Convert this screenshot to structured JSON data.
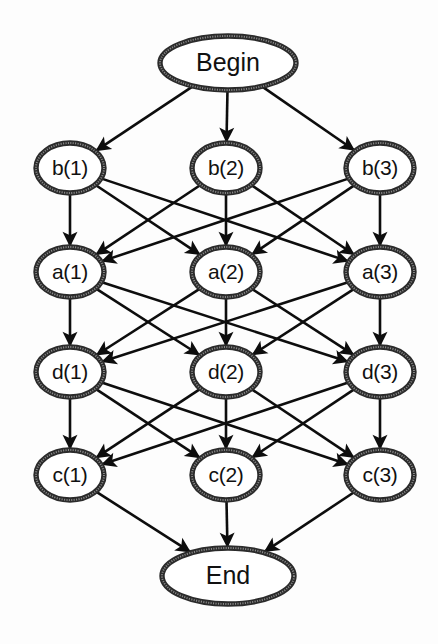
{
  "diagram": {
    "type": "layered-directed-graph",
    "canvas": {
      "width": 438,
      "height": 644,
      "background": "#fdfdfd"
    },
    "style": {
      "node_fill": "#ffffff",
      "node_border": "#2b2b2b",
      "node_border_texture": "#8a8a8a",
      "edge_color": "#0d0d0d",
      "label_color": "#111111"
    },
    "columns_x": [
      70,
      226,
      380
    ],
    "terminal_rx": 68,
    "terminal_ry": 27,
    "state_rx": 34,
    "state_ry": 25,
    "nodes": {
      "begin": {
        "id": "begin",
        "label": "Begin",
        "x": 228,
        "y": 63,
        "rx": 68,
        "ry": 27,
        "kind": "terminal"
      },
      "end": {
        "id": "end",
        "label": "End",
        "x": 228,
        "y": 576,
        "rx": 66,
        "ry": 28,
        "kind": "terminal"
      },
      "b1": {
        "id": "b1",
        "label": "b(1)",
        "x": 70,
        "y": 168,
        "rx": 34,
        "ry": 25,
        "kind": "state",
        "layer": "b"
      },
      "b2": {
        "id": "b2",
        "label": "b(2)",
        "x": 226,
        "y": 168,
        "rx": 34,
        "ry": 25,
        "kind": "state",
        "layer": "b"
      },
      "b3": {
        "id": "b3",
        "label": "b(3)",
        "x": 380,
        "y": 168,
        "rx": 34,
        "ry": 25,
        "kind": "state",
        "layer": "b"
      },
      "a1": {
        "id": "a1",
        "label": "a(1)",
        "x": 70,
        "y": 272,
        "rx": 34,
        "ry": 25,
        "kind": "state",
        "layer": "a"
      },
      "a2": {
        "id": "a2",
        "label": "a(2)",
        "x": 226,
        "y": 272,
        "rx": 34,
        "ry": 25,
        "kind": "state",
        "layer": "a"
      },
      "a3": {
        "id": "a3",
        "label": "a(3)",
        "x": 380,
        "y": 272,
        "rx": 34,
        "ry": 25,
        "kind": "state",
        "layer": "a"
      },
      "d1": {
        "id": "d1",
        "label": "d(1)",
        "x": 70,
        "y": 372,
        "rx": 34,
        "ry": 25,
        "kind": "state",
        "layer": "d"
      },
      "d2": {
        "id": "d2",
        "label": "d(2)",
        "x": 226,
        "y": 372,
        "rx": 34,
        "ry": 25,
        "kind": "state",
        "layer": "d"
      },
      "d3": {
        "id": "d3",
        "label": "d(3)",
        "x": 380,
        "y": 372,
        "rx": 34,
        "ry": 25,
        "kind": "state",
        "layer": "d"
      },
      "c1": {
        "id": "c1",
        "label": "c(1)",
        "x": 70,
        "y": 475,
        "rx": 34,
        "ry": 25,
        "kind": "state",
        "layer": "c"
      },
      "c2": {
        "id": "c2",
        "label": "c(2)",
        "x": 226,
        "y": 475,
        "rx": 34,
        "ry": 25,
        "kind": "state",
        "layer": "c"
      },
      "c3": {
        "id": "c3",
        "label": "c(3)",
        "x": 380,
        "y": 475,
        "rx": 34,
        "ry": 25,
        "kind": "state",
        "layer": "c"
      }
    },
    "layers": [
      {
        "name": "begin",
        "node_ids": [
          "begin"
        ]
      },
      {
        "name": "b",
        "node_ids": [
          "b1",
          "b2",
          "b3"
        ]
      },
      {
        "name": "a",
        "node_ids": [
          "a1",
          "a2",
          "a3"
        ]
      },
      {
        "name": "d",
        "node_ids": [
          "d1",
          "d2",
          "d3"
        ]
      },
      {
        "name": "c",
        "node_ids": [
          "c1",
          "c2",
          "c3"
        ]
      },
      {
        "name": "end",
        "node_ids": [
          "end"
        ]
      }
    ],
    "edges": [
      {
        "from": "begin",
        "to": "b1"
      },
      {
        "from": "begin",
        "to": "b2"
      },
      {
        "from": "begin",
        "to": "b3"
      },
      {
        "from": "b1",
        "to": "a1"
      },
      {
        "from": "b1",
        "to": "a2"
      },
      {
        "from": "b1",
        "to": "a3"
      },
      {
        "from": "b2",
        "to": "a1"
      },
      {
        "from": "b2",
        "to": "a2"
      },
      {
        "from": "b2",
        "to": "a3"
      },
      {
        "from": "b3",
        "to": "a1"
      },
      {
        "from": "b3",
        "to": "a2"
      },
      {
        "from": "b3",
        "to": "a3"
      },
      {
        "from": "a1",
        "to": "d1"
      },
      {
        "from": "a1",
        "to": "d2"
      },
      {
        "from": "a1",
        "to": "d3"
      },
      {
        "from": "a2",
        "to": "d1"
      },
      {
        "from": "a2",
        "to": "d2"
      },
      {
        "from": "a2",
        "to": "d3"
      },
      {
        "from": "a3",
        "to": "d1"
      },
      {
        "from": "a3",
        "to": "d2"
      },
      {
        "from": "a3",
        "to": "d3"
      },
      {
        "from": "d1",
        "to": "c1"
      },
      {
        "from": "d1",
        "to": "c2"
      },
      {
        "from": "d1",
        "to": "c3"
      },
      {
        "from": "d2",
        "to": "c1"
      },
      {
        "from": "d2",
        "to": "c2"
      },
      {
        "from": "d2",
        "to": "c3"
      },
      {
        "from": "d3",
        "to": "c1"
      },
      {
        "from": "d3",
        "to": "c2"
      },
      {
        "from": "d3",
        "to": "c3"
      },
      {
        "from": "c1",
        "to": "end"
      },
      {
        "from": "c2",
        "to": "end"
      },
      {
        "from": "c3",
        "to": "end"
      }
    ]
  }
}
